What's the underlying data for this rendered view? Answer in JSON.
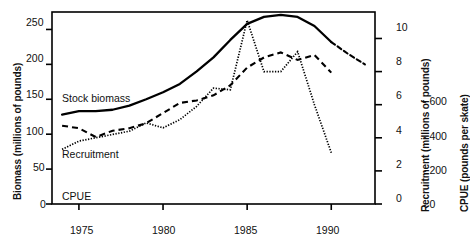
{
  "chart_data": {
    "type": "line",
    "title": "",
    "xlabel": "",
    "xlim": [
      1973.4,
      1992.6
    ],
    "xticks": [
      1975,
      1980,
      1985,
      1990
    ],
    "xtick_labels": [
      "1975",
      "1980",
      "1985",
      "1990"
    ],
    "grid": false,
    "legend_position": "inline-labels",
    "axes": [
      {
        "id": "left",
        "label": "Biomass (millions of pounds)",
        "ticks": [
          0,
          50,
          100,
          150,
          200,
          250
        ],
        "tick_labels": [
          "0",
          "50",
          "100",
          "150",
          "200",
          "250"
        ],
        "lim": [
          0,
          275
        ],
        "side": "left"
      },
      {
        "id": "right-recruitment",
        "label": "Recruitment (millions of pounds)",
        "ticks": [
          0,
          2,
          4,
          6,
          8,
          10
        ],
        "tick_labels": [
          "0",
          "2",
          "4",
          "6",
          "8",
          "10"
        ],
        "lim": [
          0,
          11.6
        ],
        "side": "right"
      },
      {
        "id": "right-cpue",
        "label": "CPUE (pounds per skate)",
        "ticks": [
          0,
          200,
          400,
          600
        ],
        "tick_labels": [
          "0",
          "200",
          "400",
          "600"
        ],
        "lim": [
          0,
          760
        ],
        "side": "right"
      }
    ],
    "series": [
      {
        "name": "Stock biomass",
        "axis": "left",
        "style": "solid",
        "inline_label": "Stock biomass",
        "x": [
          1974,
          1975,
          1976,
          1977,
          1978,
          1979,
          1980,
          1981,
          1982,
          1983,
          1984,
          1985,
          1986,
          1987,
          1988,
          1989,
          1990
        ],
        "values": [
          128,
          133,
          133,
          135,
          141,
          150,
          160,
          172,
          190,
          210,
          235,
          258,
          268,
          271,
          268,
          255,
          232
        ],
        "projection_style": "dashed",
        "projection_x": [
          1990,
          1991,
          1992
        ],
        "projection_values": [
          232,
          215,
          200
        ]
      },
      {
        "name": "Recruitment",
        "axis": "right-recruitment",
        "style": "dotted",
        "inline_label": "Recruitment",
        "x": [
          1974,
          1975,
          1976,
          1977,
          1978,
          1979,
          1980,
          1981,
          1982,
          1983,
          1984,
          1985,
          1986,
          1987,
          1988,
          1989,
          1990
        ],
        "values": [
          3.3,
          3.8,
          4.0,
          4.2,
          4.4,
          4.9,
          4.6,
          5.1,
          5.9,
          7.0,
          6.9,
          11.1,
          8.0,
          8.0,
          9.2,
          6.0,
          3.1
        ]
      },
      {
        "name": "CPUE",
        "axis": "right-cpue",
        "style": "dashed",
        "inline_label": "CPUE",
        "x": [
          1974,
          1975,
          1976,
          1977,
          1978,
          1979,
          1980,
          1981,
          1982,
          1983,
          1984,
          1985,
          1986,
          1987,
          1988,
          1989,
          1990
        ],
        "values": [
          310,
          300,
          265,
          290,
          300,
          320,
          360,
          400,
          410,
          430,
          470,
          540,
          580,
          600,
          570,
          590,
          520
        ]
      }
    ]
  },
  "labels": {
    "left_axis_title": "Biomass (millions of pounds)",
    "recruitment_axis_title": "Recruitment (millions of pounds)",
    "cpue_axis_title": "CPUE (pounds per skate)",
    "stock_biomass": "Stock biomass",
    "recruitment": "Recruitment",
    "cpue": "CPUE",
    "x_ticks": {
      "t1975": "1975",
      "t1980": "1980",
      "t1985": "1985",
      "t1990": "1990"
    },
    "left_ticks": {
      "v0": "0",
      "v50": "50",
      "v100": "100",
      "v150": "150",
      "v200": "200",
      "v250": "250"
    },
    "recruitment_ticks": {
      "v0": "0",
      "v2": "2",
      "v4": "4",
      "v6": "6",
      "v8": "8",
      "v10": "10"
    },
    "cpue_ticks": {
      "v0": "- 0",
      "v200": "- 200",
      "v400": "- 400",
      "v600": "- 600"
    }
  }
}
